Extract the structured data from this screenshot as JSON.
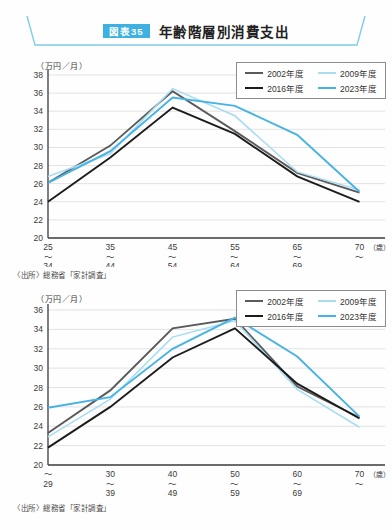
{
  "header": {
    "badge": "図表35",
    "title": "年齢階層別消費支出"
  },
  "colors": {
    "y2002": "#5a5a5a",
    "y2009": "#a9dcf2",
    "y2016": "#1c1c1c",
    "y2023": "#47b3e4",
    "accent_banner": "#7fccec",
    "badge_bg": "#3eb1e0",
    "grid": "#e2e2e2",
    "axis": "#3a3a3a"
  },
  "chart_data": [
    {
      "type": "line",
      "title": "",
      "ylabel": "（万円／月）",
      "xlabel_unit": "（歳）",
      "ylim": [
        20,
        38
      ],
      "ytick_step": 2,
      "grid": true,
      "legend_position": "top-right",
      "categories": [
        "25〜34",
        "35〜44",
        "45〜54",
        "55〜64",
        "65〜69",
        "70〜"
      ],
      "x_tick_lines": [
        [
          "25",
          "〜",
          "34"
        ],
        [
          "35",
          "〜",
          "44"
        ],
        [
          "45",
          "〜",
          "54"
        ],
        [
          "55",
          "〜",
          "64"
        ],
        [
          "65",
          "〜",
          "69"
        ],
        [
          "70",
          "〜"
        ]
      ],
      "series": [
        {
          "name": "2002年度",
          "year": "2002",
          "values": [
            26.1,
            30.2,
            36.2,
            31.8,
            27.2,
            25.0
          ]
        },
        {
          "name": "2009年度",
          "year": "2009",
          "values": [
            26.8,
            29.3,
            36.5,
            33.5,
            27.3,
            25.3
          ]
        },
        {
          "name": "2016年度",
          "year": "2016",
          "values": [
            24.0,
            28.9,
            34.4,
            31.5,
            26.8,
            24.0
          ]
        },
        {
          "name": "2023年度",
          "year": "2023",
          "values": [
            26.1,
            29.6,
            35.5,
            34.6,
            31.4,
            25.1
          ]
        }
      ],
      "source": "〈出所〉総務省「家計調査」"
    },
    {
      "type": "line",
      "title": "",
      "ylabel": "（万円／月）",
      "xlabel_unit": "（歳）",
      "ylim": [
        20,
        36
      ],
      "ytick_step": 2,
      "grid": true,
      "legend_position": "top-right",
      "categories": [
        "〜29",
        "30〜39",
        "40〜49",
        "50〜59",
        "60〜69",
        "70〜"
      ],
      "x_tick_lines": [
        [
          "〜",
          "29"
        ],
        [
          "30",
          "〜",
          "39"
        ],
        [
          "40",
          "〜",
          "49"
        ],
        [
          "50",
          "〜",
          "59"
        ],
        [
          "60",
          "〜",
          "69"
        ],
        [
          "70",
          "〜"
        ]
      ],
      "series": [
        {
          "name": "2002年度",
          "year": "2002",
          "values": [
            23.3,
            27.7,
            34.1,
            35.1,
            28.1,
            24.9
          ]
        },
        {
          "name": "2009年度",
          "year": "2009",
          "values": [
            22.9,
            26.8,
            33.2,
            34.9,
            27.8,
            23.9
          ]
        },
        {
          "name": "2016年度",
          "year": "2016",
          "values": [
            21.8,
            26.0,
            31.1,
            34.1,
            28.4,
            24.8
          ]
        },
        {
          "name": "2023年度",
          "year": "2023",
          "values": [
            25.9,
            27.0,
            32.0,
            35.2,
            31.2,
            25.0
          ]
        }
      ],
      "source": "〈出所〉総務省「家計調査」"
    }
  ]
}
